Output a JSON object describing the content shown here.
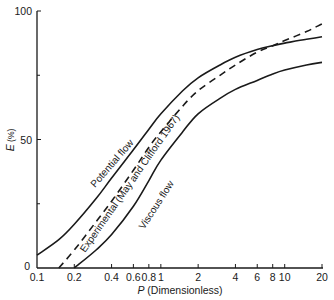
{
  "chart_data": {
    "type": "line",
    "title": "",
    "xlabel_var": "P",
    "xlabel_rest": " (Dimensionless)",
    "ylabel_var": "E",
    "ylabel_rest": " (%)",
    "xscale": "log",
    "xlim": [
      0.1,
      20
    ],
    "ylim": [
      0,
      100
    ],
    "grid": false,
    "legend": "none (curves labelled inline)",
    "x_ticks": [
      0.1,
      0.2,
      0.4,
      0.6,
      0.8,
      1,
      2,
      4,
      6,
      8,
      10,
      20
    ],
    "x_tick_labels": [
      "0.1",
      "0.2",
      "0.4",
      "0.6",
      "0.8",
      "1",
      "2",
      "4",
      "6",
      "8",
      "10",
      "20"
    ],
    "y_ticks": [
      0,
      50,
      100
    ],
    "y_tick_labels": [
      "0",
      "50",
      "100"
    ],
    "y_minor_ticks": [
      25,
      75
    ],
    "series": [
      {
        "name": "Potential flow",
        "style": "solid",
        "x": [
          0.1,
          0.15,
          0.2,
          0.3,
          0.4,
          0.6,
          0.8,
          1,
          1.5,
          2,
          3,
          4,
          6,
          8,
          10,
          15,
          20
        ],
        "y": [
          5,
          11,
          17,
          27,
          35,
          46,
          54,
          60,
          69,
          74,
          79,
          82,
          85,
          86.5,
          87.5,
          89,
          90
        ]
      },
      {
        "name": "Experimental (May and Clifford 1967)",
        "style": "dashed",
        "x": [
          0.15,
          0.2,
          0.3,
          0.4,
          0.6,
          0.8,
          1,
          1.5,
          2,
          3,
          4,
          6,
          8,
          10,
          15,
          20
        ],
        "y": [
          0,
          7,
          18,
          26,
          38,
          47,
          53,
          63,
          69,
          75,
          79,
          84,
          86.5,
          88.5,
          92,
          95
        ]
      },
      {
        "name": "Viscous flow",
        "style": "solid",
        "x": [
          0.2,
          0.3,
          0.4,
          0.6,
          0.8,
          1,
          1.5,
          2,
          3,
          4,
          6,
          8,
          10,
          15,
          20
        ],
        "y": [
          0,
          7,
          13,
          24,
          34,
          42,
          53,
          60,
          66,
          69.5,
          73,
          75.5,
          77,
          79,
          80
        ]
      }
    ],
    "annotations": [
      "Potential flow",
      "Experimental (May and Clifford 1967)",
      "Viscous flow"
    ]
  }
}
